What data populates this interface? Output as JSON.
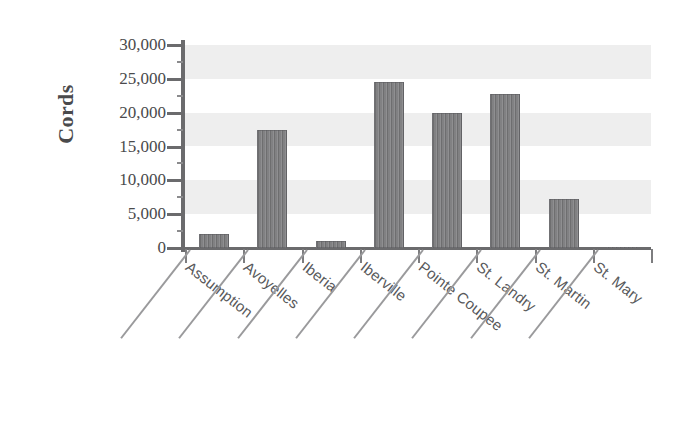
{
  "chart_data": {
    "type": "bar",
    "title": "",
    "subtitle": "",
    "xlabel": "",
    "ylabel": "Cords",
    "categories": [
      "Assumption",
      "Avoyelles",
      "Iberia",
      "Iberville",
      "Pointe Coupee",
      "St. Landry",
      "St. Martin",
      "St. Mary"
    ],
    "values": [
      2100,
      17400,
      1100,
      24600,
      20000,
      22700,
      7200,
      150
    ],
    "ylim": [
      0,
      30000
    ],
    "ytick_values": [
      0,
      5000,
      10000,
      15000,
      20000,
      25000,
      30000
    ],
    "ytick_labels": [
      "0",
      "5,000",
      "10,000",
      "15,000",
      "20,000",
      "25,000",
      "30,000"
    ],
    "grid": "horizontal alternating shaded bands every 5,000",
    "legend": "none",
    "bar_color": "#7a7a7c",
    "band_color": "#eeeeee",
    "axis_color": "#6b6b6d",
    "text_color": "#58595b",
    "background": "#ffffff"
  },
  "axis": {
    "y_title": "Cords"
  }
}
